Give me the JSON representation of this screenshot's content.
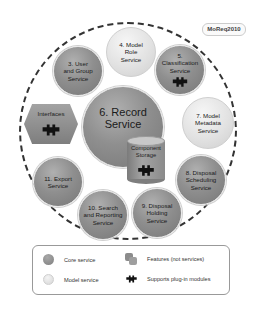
{
  "badge": {
    "label": "MoReq2010"
  },
  "services": {
    "record": {
      "line1": "6. Record",
      "line2": "Service",
      "type": "core"
    },
    "model_role": {
      "line1": "4. Model",
      "line2": "Role",
      "line3": "Service",
      "type": "model"
    },
    "user_group": {
      "line1": "3. User",
      "line2": "and Group",
      "line3": "Service",
      "type": "core"
    },
    "classification": {
      "line1": "5.",
      "line2": "Classification",
      "line3": "Service",
      "type": "core",
      "plugin": true
    },
    "model_metadata": {
      "line1": "7. Model",
      "line2": "Metadata",
      "line3": "Service",
      "type": "model"
    },
    "disposal_scheduling": {
      "line1": "8. Disposal",
      "line2": "Scheduling",
      "line3": "Service",
      "type": "core"
    },
    "disposal_holding": {
      "line1": "9. Disposal",
      "line2": "Holding",
      "line3": "Service",
      "type": "core"
    },
    "search_reporting": {
      "line1": "10. Search",
      "line2": "and Reporting",
      "line3": "Service",
      "type": "core"
    },
    "export": {
      "line1": "11. Export",
      "line2": "Service",
      "type": "core"
    }
  },
  "features": {
    "interfaces": {
      "label": "Interfaces",
      "plugin": true
    },
    "component_storage": {
      "line1": "Component",
      "line2": "Storage",
      "plugin": true
    }
  },
  "legend": {
    "core": "Core service",
    "model": "Model service",
    "features": "Features (not services)",
    "plugin": "Supports plug-in modules"
  },
  "colors": {
    "core": "#8f8f8f",
    "model": "#e2e2e2",
    "puzzle": "#111111",
    "ring": "#333333"
  }
}
